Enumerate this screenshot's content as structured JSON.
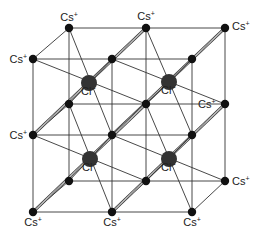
{
  "diagram": {
    "cation_label": "Cs",
    "cation_charge": "+",
    "anion_label": "Cl",
    "anion_charge": "−",
    "colors": {
      "line": "#333333",
      "cation": "#111111",
      "anion": "#333333",
      "background": "#ffffff"
    },
    "front": {
      "xs": [
        33,
        112,
        192
      ],
      "ys": [
        59,
        135,
        212
      ]
    },
    "back": {
      "xs": [
        69,
        146,
        225
      ],
      "ys": [
        28,
        104,
        181
      ]
    },
    "anions": [
      {
        "x": 89,
        "y": 83
      },
      {
        "x": 169,
        "y": 82
      },
      {
        "x": 90,
        "y": 159
      },
      {
        "x": 169,
        "y": 159
      }
    ],
    "cation_labels": [
      {
        "x": 69,
        "y": 21,
        "anchor": "middle"
      },
      {
        "x": 146,
        "y": 20,
        "anchor": "middle"
      },
      {
        "x": 232,
        "y": 30,
        "anchor": "start"
      },
      {
        "x": 27,
        "y": 63,
        "anchor": "end"
      },
      {
        "x": 198,
        "y": 108,
        "anchor": "start"
      },
      {
        "x": 27,
        "y": 139,
        "anchor": "end"
      },
      {
        "x": 232,
        "y": 185,
        "anchor": "start"
      },
      {
        "x": 33,
        "y": 226,
        "anchor": "middle"
      },
      {
        "x": 112,
        "y": 226,
        "anchor": "middle"
      },
      {
        "x": 192,
        "y": 226,
        "anchor": "middle"
      }
    ]
  }
}
